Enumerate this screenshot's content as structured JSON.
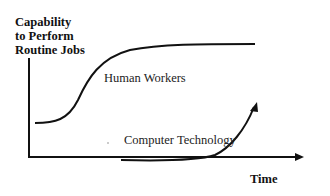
{
  "diagram": {
    "y_axis_label": [
      "Capability",
      "to Perform",
      "Routine Jobs"
    ],
    "x_axis_label": "Time",
    "curves": [
      {
        "name": "human-workers",
        "label": "Human Workers",
        "shape": "s-curve rising then plateau"
      },
      {
        "name": "computer-technology",
        "label": "Computer Technology",
        "shape": "flat then exponential rise with arrow"
      }
    ],
    "colors": {
      "line": "#111111",
      "background": "#ffffff"
    }
  }
}
